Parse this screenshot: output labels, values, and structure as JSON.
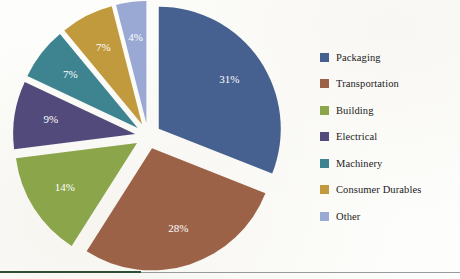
{
  "chart_data": {
    "type": "pie",
    "title": "",
    "exploded": true,
    "start_angle_deg": 0,
    "direction": "clockwise",
    "legend_position": "right",
    "categories": [
      "Packaging",
      "Transportation",
      "Building",
      "Electrical",
      "Machinery",
      "Consumer Durables",
      "Other"
    ],
    "values": [
      31,
      28,
      14,
      9,
      7,
      7,
      4
    ],
    "value_labels": [
      "31%",
      "28%",
      "14%",
      "9%",
      "7%",
      "7%",
      "4%"
    ],
    "unit": "%",
    "colors": [
      "#46618f",
      "#9c6248",
      "#8aa54a",
      "#514a7a",
      "#3e8490",
      "#c19a3e",
      "#9aa8d4"
    ],
    "slices": [
      {
        "label": "Packaging",
        "value": 31,
        "value_label": "31%",
        "color": "#46618f"
      },
      {
        "label": "Transportation",
        "value": 28,
        "value_label": "28%",
        "color": "#9c6248"
      },
      {
        "label": "Building",
        "value": 14,
        "value_label": "14%",
        "color": "#8aa54a"
      },
      {
        "label": "Electrical",
        "value": 9,
        "value_label": "9%",
        "color": "#514a7a"
      },
      {
        "label": "Machinery",
        "value": 7,
        "value_label": "7%",
        "color": "#3e8490"
      },
      {
        "label": "Consumer Durables",
        "value": 7,
        "value_label": "7%",
        "color": "#c19a3e"
      },
      {
        "label": "Other",
        "value": 4,
        "value_label": "4%",
        "color": "#9aa8d4"
      }
    ]
  },
  "legend": {
    "items": [
      {
        "label": "Packaging",
        "color": "#46618f"
      },
      {
        "label": "Transportation",
        "color": "#9c6248"
      },
      {
        "label": "Building",
        "color": "#8aa54a"
      },
      {
        "label": "Electrical",
        "color": "#514a7a"
      },
      {
        "label": "Machinery",
        "color": "#3e8490"
      },
      {
        "label": "Consumer Durables",
        "color": "#c19a3e"
      },
      {
        "label": "Other",
        "color": "#9aa8d4"
      }
    ]
  },
  "footer": {
    "rule_green_color": "#2f4f34",
    "rule_gray_color": "#9a9a9a"
  }
}
